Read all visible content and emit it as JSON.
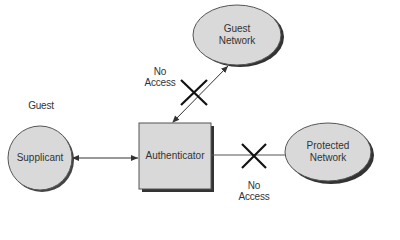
{
  "diagram": {
    "nodes": {
      "supplicant": {
        "label": "Supplicant",
        "caption": "Guest"
      },
      "authenticator": {
        "label": "Authenticator"
      },
      "guest_network": {
        "line1": "Guest",
        "line2": "Network"
      },
      "protected_network": {
        "line1": "Protected",
        "line2": "Network"
      }
    },
    "edges": {
      "supplicant_authenticator": {
        "style": "bidirectional-arrow"
      },
      "authenticator_guest": {
        "style": "bidirectional-arrow",
        "blocked": true,
        "label_line1": "No",
        "label_line2": "Access"
      },
      "authenticator_protected": {
        "style": "line",
        "blocked": true,
        "label_line1": "No",
        "label_line2": "Access"
      }
    },
    "colors": {
      "node_fill": "#d9d9d9",
      "shadow": "#333333",
      "stroke": "#444444"
    }
  }
}
